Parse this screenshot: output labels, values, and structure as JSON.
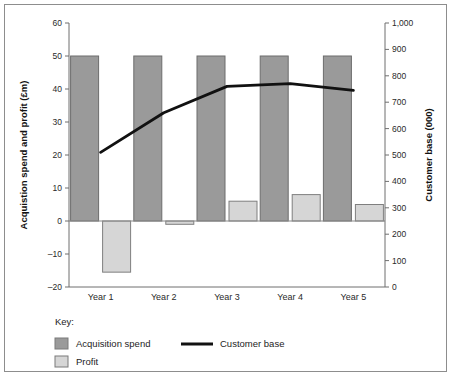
{
  "chart_data": {
    "type": "bar",
    "title": "",
    "subtitle": "",
    "categories": [
      "Year 1",
      "Year 2",
      "Year 3",
      "Year 4",
      "Year 5"
    ],
    "xlabel": "",
    "ylabel": "Acquistion spend and profit (£m)",
    "y2label": "Customer base (000)",
    "ylim": [
      -20,
      60
    ],
    "y2lim": [
      0,
      1000
    ],
    "yticks": [
      "60",
      "50",
      "40",
      "30",
      "20",
      "10",
      "0",
      "–10",
      "–20"
    ],
    "ytick_values": [
      60,
      50,
      40,
      30,
      20,
      10,
      0,
      -10,
      -20
    ],
    "y2ticks": [
      "1,000",
      "900",
      "800",
      "700",
      "600",
      "500",
      "400",
      "300",
      "200",
      "100",
      "0"
    ],
    "y2tick_values": [
      1000,
      900,
      800,
      700,
      600,
      500,
      400,
      300,
      200,
      100,
      0
    ],
    "grid": false,
    "legend_position": "below-plot",
    "series": [
      {
        "name": "Acquisition spend",
        "type": "bar",
        "axis": "left",
        "color": "#9a9a9a",
        "values": [
          50,
          50,
          50,
          50,
          50
        ]
      },
      {
        "name": "Profit",
        "type": "bar",
        "axis": "left",
        "color": "#d6d6d6",
        "values": [
          -15.5,
          -1,
          6,
          8,
          5
        ]
      },
      {
        "name": "Customer base",
        "type": "line",
        "axis": "right",
        "color": "#111111",
        "values": [
          510,
          660,
          760,
          770,
          745
        ]
      }
    ]
  },
  "legend": {
    "key_label": "Key:",
    "entries": [
      {
        "label": "Acquisition spend",
        "swatch": "#9a9a9a",
        "kind": "box"
      },
      {
        "label": "Profit",
        "swatch": "#d6d6d6",
        "kind": "box"
      },
      {
        "label": "Customer base",
        "swatch": "#111111",
        "kind": "line"
      }
    ]
  }
}
